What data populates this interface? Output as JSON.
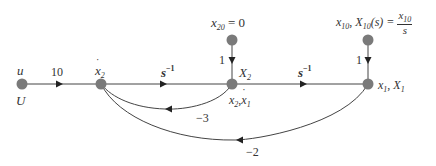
{
  "diagram": {
    "type": "signal-flow-graph",
    "nodes": [
      {
        "id": "u",
        "label_top": "u",
        "label_bottom": "U",
        "x": 22,
        "y": 84
      },
      {
        "id": "x2dot",
        "label_top": "ẋ₂",
        "x": 101,
        "y": 84
      },
      {
        "id": "X2",
        "label_right": "X₂",
        "label_below": "x₂, ẋ₁",
        "x": 232,
        "y": 84
      },
      {
        "id": "X1",
        "label_right": "x₁, X₁",
        "x": 368,
        "y": 84
      },
      {
        "id": "x20",
        "label": "x₂₀ = 0",
        "x": 232,
        "y": 40
      },
      {
        "id": "x10",
        "label": "x₁₀, X₁₀(s) = x₁₀ / s",
        "x": 368,
        "y": 40
      }
    ],
    "edges": [
      {
        "from": "u",
        "to": "x2dot",
        "gain": "10"
      },
      {
        "from": "x2dot",
        "to": "X2",
        "gain": "s⁻¹"
      },
      {
        "from": "X2",
        "to": "X1",
        "gain": "s⁻¹"
      },
      {
        "from": "x20",
        "to": "X2",
        "gain": "1"
      },
      {
        "from": "x10",
        "to": "X1",
        "gain": "1"
      },
      {
        "from": "X2",
        "to": "x2dot",
        "gain": "−3"
      },
      {
        "from": "X1",
        "to": "x2dot",
        "gain": "−2"
      }
    ]
  },
  "labels": {
    "u_top": "u",
    "u_bottom": "U",
    "x2dot_var": "x",
    "x2dot_sub": "2",
    "X2_var": "X",
    "X2_sub": "2",
    "x2_var": "x",
    "x2_sub": "2",
    "x1dot_var": "x",
    "x1dot_sub": "1",
    "X1_pair_x": "x",
    "X1_pair_x_sub": "1",
    "X1_pair_X": "X",
    "X1_pair_X_sub": "1",
    "x20_var": "x",
    "x20_sub": "20",
    "x20_eq": " = 0",
    "x10_var": "x",
    "x10_sub": "10",
    "X10_var": "X",
    "X10_sub": "10",
    "X10_arg": "(s) = ",
    "frac_num_var": "x",
    "frac_num_sub": "10",
    "frac_den": "s",
    "comma": ", "
  },
  "gains": {
    "g_u_x2dot": "10",
    "g_x2dot_X2_base": "s",
    "g_x2dot_X2_exp": "−1",
    "g_X2_X1_base": "s",
    "g_X2_X1_exp": "−1",
    "g_x20": "1",
    "g_x10": "1",
    "g_fb3": "−3",
    "g_fb2": "−2"
  },
  "colors": {
    "node": "#7a7a7a",
    "line": "#333333",
    "text": "#333333"
  }
}
